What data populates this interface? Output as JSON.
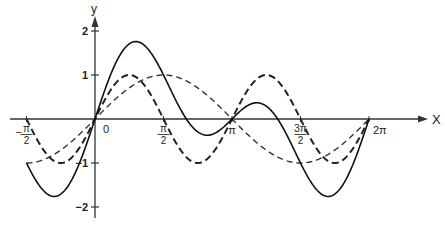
{
  "chart_data": {
    "type": "line",
    "title": "",
    "xlabel": "x",
    "ylabel": "y",
    "xlim": [
      -1.5708,
      6.2832
    ],
    "ylim": [
      -2,
      2
    ],
    "grid": false,
    "legend": null,
    "x_ticks": [
      {
        "value": -1.5708,
        "label": "-π/2"
      },
      {
        "value": 0,
        "label": "0"
      },
      {
        "value": 1.5708,
        "label": "π/2"
      },
      {
        "value": 3.1416,
        "label": "π"
      },
      {
        "value": 4.7124,
        "label": "3π/2"
      },
      {
        "value": 6.2832,
        "label": "2π"
      }
    ],
    "y_ticks": [
      {
        "value": 2,
        "label": "2"
      },
      {
        "value": 1,
        "label": "1"
      },
      {
        "value": -1,
        "label": "-1"
      },
      {
        "value": -2,
        "label": "-2"
      }
    ],
    "series": [
      {
        "name": "sin x",
        "style": "dashed-light",
        "function": "sin(x)",
        "key_points": [
          [
            -1.5708,
            -1
          ],
          [
            0,
            0
          ],
          [
            1.5708,
            1
          ],
          [
            3.1416,
            0
          ],
          [
            4.7124,
            -1
          ],
          [
            6.2832,
            0
          ]
        ]
      },
      {
        "name": "sin 2x",
        "style": "dashed-heavy",
        "function": "sin(2x)",
        "key_points": [
          [
            -1.5708,
            0
          ],
          [
            -0.7854,
            -1
          ],
          [
            0,
            0
          ],
          [
            0.7854,
            1
          ],
          [
            1.5708,
            0
          ],
          [
            2.3562,
            -1
          ],
          [
            3.1416,
            0
          ],
          [
            3.927,
            1
          ],
          [
            4.7124,
            0
          ],
          [
            5.4978,
            -1
          ],
          [
            6.2832,
            0
          ]
        ]
      },
      {
        "name": "sin x + sin 2x",
        "style": "solid",
        "function": "sin(x)+sin(2x)",
        "key_points": [
          [
            -1.5708,
            -1
          ],
          [
            -0.94,
            -1.76
          ],
          [
            0,
            0
          ],
          [
            0.94,
            1.76
          ],
          [
            2.0944,
            0
          ],
          [
            2.57,
            -0.37
          ],
          [
            3.1416,
            0
          ],
          [
            3.71,
            0.37
          ],
          [
            4.1888,
            0
          ],
          [
            5.34,
            -1.76
          ],
          [
            6.2832,
            0
          ]
        ]
      }
    ]
  },
  "axes": {
    "x_axis_label": "x",
    "y_axis_label": "y",
    "origin_label": "0"
  }
}
